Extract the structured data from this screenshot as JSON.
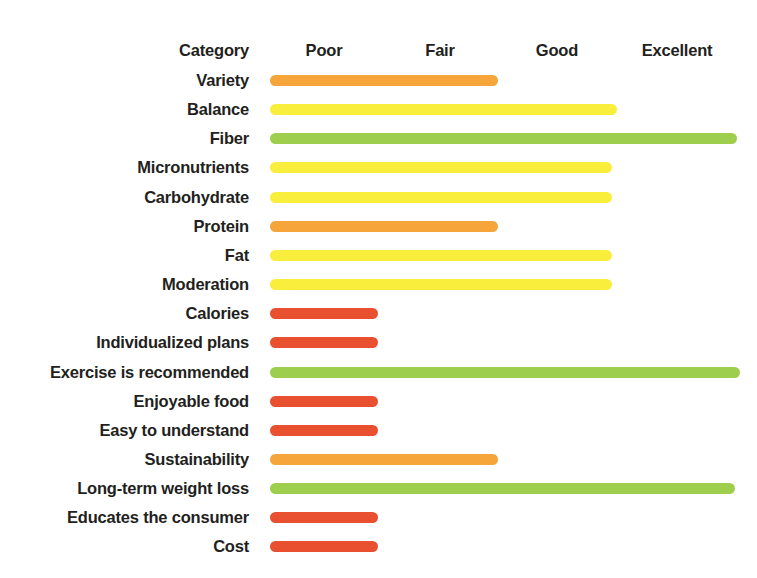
{
  "chart_data": {
    "type": "bar",
    "title": "",
    "subtitle": "",
    "xlabel": "",
    "ylabel": "",
    "orientation": "horizontal",
    "grid": false,
    "legend_position": "none",
    "category_header": "Category",
    "scale_labels": [
      "Poor",
      "Fair",
      "Good",
      "Excellent"
    ],
    "scale_values": [
      1,
      2,
      3,
      4
    ],
    "xlim": [
      0,
      4
    ],
    "colors": {
      "poor": "#E8502F",
      "fair": "#F5A53A",
      "good": "#FAEE3C",
      "excellent": "#9DCE4D"
    },
    "categories": [
      "Variety",
      "Balance",
      "Fiber",
      "Micronutrients",
      "Carbohydrate",
      "Protein",
      "Fat",
      "Moderation",
      "Calories",
      "Individualized plans",
      "Exercise is recommended",
      "Enjoyable food",
      "Easy to understand",
      "Sustainability",
      "Long-term weight loss",
      "Educates the consumer",
      "Cost"
    ],
    "values": [
      1.9,
      2.9,
      3.9,
      2.85,
      2.85,
      1.9,
      2.85,
      2.85,
      0.9,
      0.9,
      3.95,
      0.9,
      0.9,
      1.9,
      3.9,
      0.9,
      0.9
    ],
    "ratings": [
      "Fair",
      "Good",
      "Excellent",
      "Good",
      "Good",
      "Fair",
      "Good",
      "Good",
      "Poor",
      "Poor",
      "Excellent",
      "Poor",
      "Poor",
      "Fair",
      "Excellent",
      "Poor",
      "Poor"
    ],
    "bars": [
      {
        "label": "Variety",
        "rating": "Fair",
        "value": 1.9,
        "width_px": 228,
        "color": "#F5A53A"
      },
      {
        "label": "Balance",
        "rating": "Good",
        "value": 2.9,
        "width_px": 347,
        "color": "#FAEE3C"
      },
      {
        "label": "Fiber",
        "rating": "Excellent",
        "value": 3.9,
        "width_px": 467,
        "color": "#9DCE4D"
      },
      {
        "label": "Micronutrients",
        "rating": "Good",
        "value": 2.85,
        "width_px": 342,
        "color": "#FAEE3C"
      },
      {
        "label": "Carbohydrate",
        "rating": "Good",
        "value": 2.85,
        "width_px": 342,
        "color": "#FAEE3C"
      },
      {
        "label": "Protein",
        "rating": "Fair",
        "value": 1.9,
        "width_px": 228,
        "color": "#F5A53A"
      },
      {
        "label": "Fat",
        "rating": "Good",
        "value": 2.85,
        "width_px": 342,
        "color": "#FAEE3C"
      },
      {
        "label": "Moderation",
        "rating": "Good",
        "value": 2.85,
        "width_px": 342,
        "color": "#FAEE3C"
      },
      {
        "label": "Calories",
        "rating": "Poor",
        "value": 0.9,
        "width_px": 108,
        "color": "#E8502F"
      },
      {
        "label": "Individualized plans",
        "rating": "Poor",
        "value": 0.9,
        "width_px": 108,
        "color": "#E8502F"
      },
      {
        "label": "Exercise is recommended",
        "rating": "Excellent",
        "value": 3.95,
        "width_px": 470,
        "color": "#9DCE4D"
      },
      {
        "label": "Enjoyable food",
        "rating": "Poor",
        "value": 0.9,
        "width_px": 108,
        "color": "#E8502F"
      },
      {
        "label": "Easy to understand",
        "rating": "Poor",
        "value": 0.9,
        "width_px": 108,
        "color": "#E8502F"
      },
      {
        "label": "Sustainability",
        "rating": "Fair",
        "value": 1.9,
        "width_px": 228,
        "color": "#F5A53A"
      },
      {
        "label": "Long-term weight loss",
        "rating": "Excellent",
        "value": 3.9,
        "width_px": 465,
        "color": "#9DCE4D"
      },
      {
        "label": "Educates the consumer",
        "rating": "Poor",
        "value": 0.9,
        "width_px": 108,
        "color": "#E8502F"
      },
      {
        "label": "Cost",
        "rating": "Poor",
        "value": 0.9,
        "width_px": 108,
        "color": "#E8502F"
      }
    ]
  },
  "header": {
    "category": "Category",
    "ratings": [
      {
        "label": "Poor",
        "center_px": 324
      },
      {
        "label": "Fair",
        "center_px": 440
      },
      {
        "label": "Good",
        "center_px": 557
      },
      {
        "label": "Excellent",
        "center_px": 677
      }
    ]
  }
}
